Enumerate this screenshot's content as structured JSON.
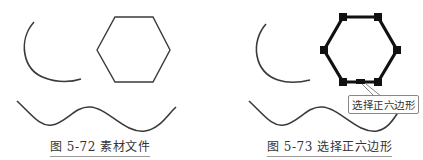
{
  "figures": [
    {
      "id": "left",
      "caption": "图 5-72 素材文件",
      "shapes": [
        "arc",
        "hexagon",
        "wave-curve"
      ]
    },
    {
      "id": "right",
      "caption": "图 5-73 选择正六边形",
      "callout": "选择正六边形",
      "shapes": [
        "arc",
        "hexagon-selected",
        "wave-curve"
      ]
    }
  ],
  "colors": {
    "stroke": "#3a3a3a",
    "selection": "#111111",
    "caption_underline": "#9a9a9a"
  }
}
